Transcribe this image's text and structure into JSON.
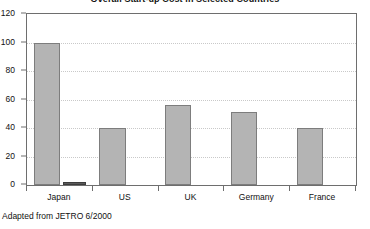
{
  "chart_data": {
    "type": "bar",
    "title": "Overall Start-up Cost in Selected Countries",
    "subtitle": "",
    "xlabel": "",
    "ylabel": "",
    "categories": [
      "Japan",
      "US",
      "UK",
      "Germany",
      "France"
    ],
    "series": [
      {
        "name": "Overall start-up cost",
        "values": [
          100,
          40,
          56,
          51,
          40
        ]
      },
      {
        "name": "Secondary measure",
        "values": [
          2,
          null,
          null,
          null,
          null
        ]
      }
    ],
    "values": [
      100,
      40,
      56,
      51,
      40
    ],
    "ylim": [
      0,
      120
    ],
    "ytick_labels": [
      "0",
      "20",
      "40",
      "60",
      "80",
      "100",
      "120"
    ],
    "ytick_values": [
      0,
      20,
      40,
      60,
      80,
      100,
      120
    ],
    "grid": true,
    "grid_axis": "y",
    "legend": false,
    "legend_position": "none",
    "bar_color": "#b4b4b4",
    "bar_border_color": "#7d7d7d",
    "small_bar_color": "#5a5a5a",
    "frame_color": "#6e6e6e",
    "gridline_color": "#c9c9c9"
  },
  "source_note": "Adapted from JETRO 6/2000"
}
